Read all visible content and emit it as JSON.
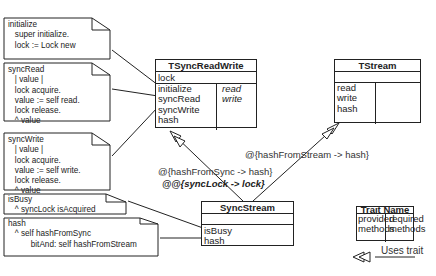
{
  "notes": [
    {
      "id": "initialize",
      "lines": [
        "initialize",
        "   super initialize.",
        "   lock := Lock new"
      ]
    },
    {
      "id": "syncRead",
      "lines": [
        "syncRead",
        "   | value |",
        "   lock acquire.",
        "   value := self read.",
        "   lock release.",
        "   ^ value"
      ]
    },
    {
      "id": "syncWrite",
      "lines": [
        "syncWrite",
        "   | value |",
        "   lock acquire.",
        "   value := self write.",
        "   lock release.",
        "   ^ value"
      ]
    },
    {
      "id": "isBusy",
      "lines": [
        "isBusy",
        "   ^ syncLock isAcquired"
      ]
    },
    {
      "id": "hash",
      "lines": [
        "hash",
        "   ^ self hashFromSync",
        "          bitAnd: self hashFromStream"
      ]
    }
  ],
  "classes": {
    "tsyncreadwrite": {
      "title": "TSyncReadWrite",
      "attributes": [
        "lock"
      ],
      "provided": [
        "initialize",
        "syncRead",
        "syncWrite",
        "hash"
      ],
      "required": [
        "read",
        "write"
      ]
    },
    "tstream": {
      "title": "TStream",
      "attributes": [],
      "provided": [
        "read",
        "write",
        "hash"
      ],
      "required": []
    },
    "syncstream": {
      "title": "SyncStream",
      "attributes": [],
      "methods": [
        "isBusy",
        "hash"
      ]
    }
  },
  "labels": {
    "alias_sync": "@{hashFromSync -> hash}",
    "rename_lock": "@@{syncLock -> lock}",
    "alias_stream": "@{hashFromStream -> hash}"
  },
  "legend": {
    "title": "Trait Name",
    "provided": [
      "provided",
      "methods"
    ],
    "required": [
      "required",
      "methods"
    ],
    "uses_trait": "Uses trait"
  }
}
